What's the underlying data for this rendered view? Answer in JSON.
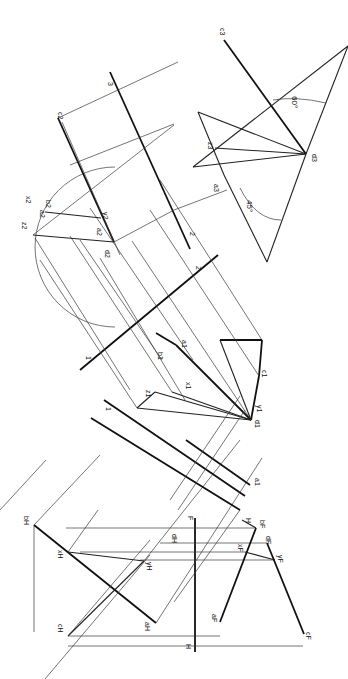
{
  "drawing": {
    "title": "",
    "orientation": "rotated 90 degrees clockwise",
    "colors": {
      "ink": "#111111",
      "paper": "#ffffff"
    },
    "views": {
      "front_view": {
        "fold_line_label_top": "F",
        "fold_line_label_bottom": "H",
        "points": {
          "a": "aF",
          "b": "bF",
          "c": "cF",
          "d": "dF",
          "x": "xF",
          "y": "yF"
        }
      },
      "top_view": {
        "points": {
          "a": "aH",
          "b": "bH",
          "c": "cH",
          "d": "dH",
          "x": "xH",
          "y": "yH"
        },
        "fold_labels": [
          "H",
          "1"
        ]
      },
      "auxiliary_1": {
        "points": {
          "a": "a1",
          "b": "b1",
          "c": "c1",
          "d": "d1",
          "x": "x1",
          "y": "y1",
          "z": "z1"
        },
        "fold_labels": [
          "1",
          "2"
        ]
      },
      "auxiliary_2": {
        "points": {
          "a": "a2",
          "b": "b2",
          "c": "c2",
          "d": "d2",
          "x": "x2",
          "y": "y2",
          "z": "z2"
        },
        "fold_labels": [
          "2",
          "3"
        ]
      },
      "auxiliary_3": {
        "points": {
          "a": "a3",
          "c": "c3",
          "d": "d3",
          "z": "z3"
        }
      }
    },
    "labels": {
      "F": "F",
      "H_front": "H",
      "H_top": "H",
      "one_a": "1",
      "one_b": "1",
      "two_a": "2",
      "two_b": "2",
      "three": "3",
      "aF": "aF",
      "bF": "bF",
      "dF": "dF",
      "xF": "xF",
      "yF": "yF",
      "cF": "cF",
      "aH": "aH",
      "bH": "bH",
      "cH": "cH",
      "dH": "dH",
      "xH": "xH",
      "yH": "yH",
      "a1": "a1",
      "b1": "b1",
      "c1": "c1",
      "d1": "d1",
      "x1": "x1",
      "y1": "y1",
      "z1": "z1",
      "a2": "a2",
      "b2": "b2",
      "c2": "c2",
      "d2": "d2",
      "x2": "x2",
      "y2": "y2",
      "z2": "z2",
      "a3": "a3",
      "c3": "c3",
      "d3": "d3",
      "z3": "z3"
    },
    "angles": {
      "angle_60": "60°",
      "angle_45": "45°"
    }
  }
}
